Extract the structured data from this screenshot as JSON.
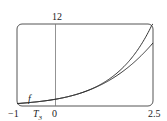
{
  "chart_data": {
    "type": "line",
    "title": "",
    "xlabel": "",
    "ylabel": "",
    "xlim": [
      -1,
      2.5
    ],
    "ylim": [
      0,
      12
    ],
    "x_tick_labels": [
      "-1",
      "0",
      "2.5"
    ],
    "y_tick_labels": [
      "12"
    ],
    "grid": false,
    "series": [
      {
        "name": "f",
        "formula": "e^x",
        "x": [
          -1,
          -0.5,
          0,
          0.5,
          1,
          1.5,
          2,
          2.5
        ],
        "values": [
          0.37,
          0.61,
          1.0,
          1.65,
          2.72,
          4.48,
          7.39,
          12.18
        ]
      },
      {
        "name": "T3",
        "formula": "1 + x + x^2/2 + x^3/6",
        "x": [
          -1,
          -0.5,
          0,
          0.5,
          1,
          1.5,
          2,
          2.5
        ],
        "values": [
          0.33,
          0.6,
          1.0,
          1.65,
          2.67,
          4.19,
          6.33,
          9.23
        ]
      }
    ],
    "annotations": [
      "f",
      "T3"
    ]
  },
  "labels": {
    "x_min": "−1",
    "x_zero": "0",
    "x_max": "2.5",
    "y_max": "12",
    "f": "f",
    "t": "T",
    "t_sub": "3"
  }
}
